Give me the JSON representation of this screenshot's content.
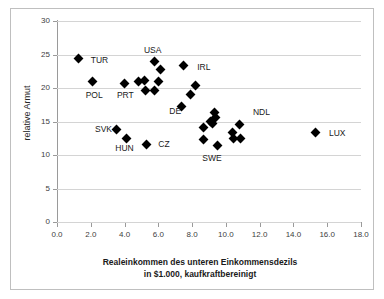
{
  "chart_data": {
    "type": "scatter",
    "title": "",
    "xlabel_line1": "Realeinkommen des unteren Einkommensdezils",
    "xlabel_line2": "in $1.000, kaufkraftbereinigt",
    "ylabel": "relative Armut",
    "xlim": [
      0.0,
      18.0
    ],
    "ylim": [
      0,
      30
    ],
    "xticks": [
      "0.0",
      "2.0",
      "4.0",
      "6.0",
      "8.0",
      "10.0",
      "12.0",
      "14.0",
      "16.0",
      "18.0"
    ],
    "xtick_values": [
      0.0,
      2.0,
      4.0,
      6.0,
      8.0,
      10.0,
      12.0,
      14.0,
      16.0,
      18.0
    ],
    "yticks": [
      "0",
      "5",
      "10",
      "15",
      "20",
      "25",
      "30"
    ],
    "ytick_values": [
      0,
      5,
      10,
      15,
      20,
      25,
      30
    ],
    "grid": "horizontal",
    "legend": "none",
    "marker": "filled-diamond",
    "marker_color": "#000000",
    "points": [
      {
        "x": 1.3,
        "y": 24.4
      },
      {
        "x": 2.1,
        "y": 20.9
      },
      {
        "x": 3.5,
        "y": 13.8
      },
      {
        "x": 4.0,
        "y": 20.7
      },
      {
        "x": 4.1,
        "y": 12.4
      },
      {
        "x": 4.8,
        "y": 20.9
      },
      {
        "x": 5.2,
        "y": 21.1
      },
      {
        "x": 5.25,
        "y": 19.7
      },
      {
        "x": 5.3,
        "y": 11.5
      },
      {
        "x": 5.75,
        "y": 24.0
      },
      {
        "x": 5.8,
        "y": 19.7
      },
      {
        "x": 6.0,
        "y": 20.9
      },
      {
        "x": 6.15,
        "y": 22.8
      },
      {
        "x": 7.4,
        "y": 17.3
      },
      {
        "x": 7.5,
        "y": 23.4
      },
      {
        "x": 7.9,
        "y": 19.1
      },
      {
        "x": 8.2,
        "y": 20.4
      },
      {
        "x": 8.65,
        "y": 14.1
      },
      {
        "x": 8.7,
        "y": 12.3
      },
      {
        "x": 9.1,
        "y": 15.0
      },
      {
        "x": 9.2,
        "y": 14.7
      },
      {
        "x": 9.3,
        "y": 16.3
      },
      {
        "x": 9.4,
        "y": 15.6
      },
      {
        "x": 9.5,
        "y": 11.4
      },
      {
        "x": 10.4,
        "y": 13.4
      },
      {
        "x": 10.45,
        "y": 12.4
      },
      {
        "x": 10.8,
        "y": 14.5
      },
      {
        "x": 10.85,
        "y": 12.5
      },
      {
        "x": 15.3,
        "y": 13.4
      }
    ],
    "annotations": [
      {
        "text": "TUR",
        "x": 2.0,
        "y": 24.2
      },
      {
        "text": "POL",
        "x": 1.7,
        "y": 18.9
      },
      {
        "text": "PRT",
        "x": 3.55,
        "y": 18.9
      },
      {
        "text": "USA",
        "x": 5.15,
        "y": 25.7
      },
      {
        "text": "IRL",
        "x": 8.3,
        "y": 23.2
      },
      {
        "text": "DE",
        "x": 6.65,
        "y": 16.5
      },
      {
        "text": "SVK",
        "x": 2.25,
        "y": 13.9
      },
      {
        "text": "HUN",
        "x": 3.45,
        "y": 11.1
      },
      {
        "text": "CZ",
        "x": 6.0,
        "y": 11.6
      },
      {
        "text": "SWE",
        "x": 8.6,
        "y": 9.6
      },
      {
        "text": "NDL",
        "x": 11.6,
        "y": 16.4
      },
      {
        "text": "LUX",
        "x": 16.1,
        "y": 13.3
      }
    ]
  }
}
